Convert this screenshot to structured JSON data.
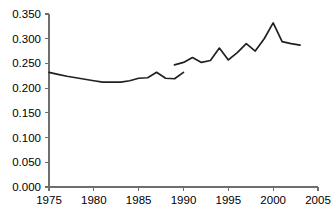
{
  "chart_data": {
    "type": "line",
    "title": "",
    "subtitle": "",
    "xlabel": "",
    "ylabel": "",
    "xlim": [
      1975,
      2005
    ],
    "ylim": [
      0.0,
      0.35
    ],
    "grid": false,
    "legend_position": "none",
    "x_ticks": [
      "1975",
      "1980",
      "1985",
      "1990",
      "1995",
      "2000",
      "2005"
    ],
    "x_tick_values": [
      1975,
      1980,
      1985,
      1990,
      1995,
      2000,
      2005
    ],
    "y_ticks": [
      "0.000",
      "0.050",
      "0.100",
      "0.150",
      "0.200",
      "0.250",
      "0.300",
      "0.350"
    ],
    "y_tick_values": [
      0.0,
      0.05,
      0.1,
      0.15,
      0.2,
      0.25,
      0.3,
      0.35
    ],
    "line_color": "#231f20",
    "axis_color": "#6e6e6e",
    "series": [
      {
        "name": "series-1",
        "x": [
          1975,
          1976,
          1977,
          1978,
          1979,
          1980,
          1981,
          1982,
          1983,
          1984,
          1985,
          1986,
          1987,
          1988,
          1989,
          1990
        ],
        "values": [
          0.232,
          0.228,
          0.224,
          0.221,
          0.218,
          0.215,
          0.212,
          0.212,
          0.212,
          0.215,
          0.22,
          0.221,
          0.232,
          0.22,
          0.219,
          0.232
        ]
      },
      {
        "name": "series-2",
        "x": [
          1989,
          1990,
          1991,
          1992,
          1993,
          1994,
          1995,
          1996,
          1997,
          1998,
          1999,
          2000,
          2001,
          2002,
          2003
        ],
        "values": [
          0.247,
          0.252,
          0.262,
          0.252,
          0.256,
          0.281,
          0.257,
          0.272,
          0.29,
          0.275,
          0.3,
          0.332,
          0.294,
          0.29,
          0.287
        ]
      }
    ]
  },
  "plot_geometry": {
    "left": 49,
    "right": 318,
    "top": 14,
    "bottom": 187
  }
}
